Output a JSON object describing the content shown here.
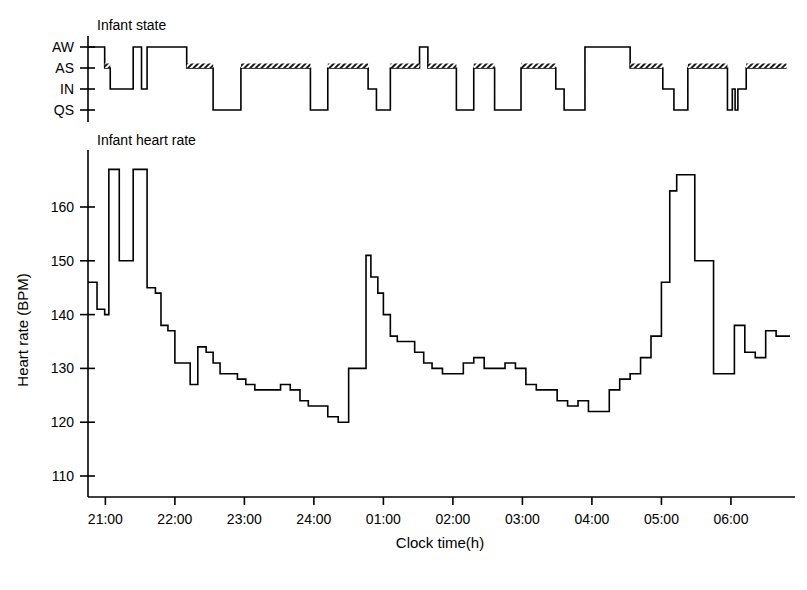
{
  "figure": {
    "background": "#ffffff",
    "line_color": "#000000",
    "panels": [
      {
        "id": "infant-state",
        "title": "Infant state",
        "y_categories": [
          "AW",
          "AS",
          "IN",
          "QS"
        ]
      },
      {
        "id": "infant-heart-rate",
        "title": "Infant heart rate",
        "y_axis_title": "Heart rate (BPM)"
      }
    ],
    "x_axis_title": "Clock time(h)",
    "x_tick_labels": [
      "21:00",
      "22:00",
      "23:00",
      "24:00",
      "01:00",
      "02:00",
      "03:00",
      "04:00",
      "05:00",
      "06:00"
    ]
  },
  "chart_data": [
    {
      "type": "line",
      "subtype": "step",
      "id": "infant-state",
      "title": "Infant state",
      "xlabel": "Clock time(h)",
      "ylabel": "",
      "y_categories": [
        "QS",
        "IN",
        "AS",
        "AW"
      ],
      "y_tick_labels": [
        "AW",
        "AS",
        "IN",
        "QS"
      ],
      "xlim": [
        20.75,
        26.8
      ],
      "x_tick_values": [
        21,
        22,
        23,
        24,
        25,
        26,
        27,
        28,
        29,
        30
      ],
      "x_tick_labels": [
        "21:00",
        "22:00",
        "23:00",
        "24:00",
        "01:00",
        "02:00",
        "03:00",
        "04:00",
        "05:00",
        "06:00"
      ],
      "grid": false,
      "legend": "none",
      "note": "Hypnogram: stepwise state trace. Segments drawn at level AS carry a hatched (cross-shaded) top edge.",
      "segments": [
        {
          "start": 20.75,
          "end": 20.99,
          "state": "AW",
          "hatched": false
        },
        {
          "start": 20.99,
          "end": 21.07,
          "state": "AS",
          "hatched": true
        },
        {
          "start": 21.07,
          "end": 21.4,
          "state": "IN",
          "hatched": false
        },
        {
          "start": 21.4,
          "end": 21.52,
          "state": "AW",
          "hatched": false
        },
        {
          "start": 21.52,
          "end": 21.6,
          "state": "IN",
          "hatched": false
        },
        {
          "start": 21.6,
          "end": 21.72,
          "state": "AW",
          "hatched": false
        },
        {
          "start": 21.72,
          "end": 22.17,
          "state": "AW",
          "hatched": false
        },
        {
          "start": 22.17,
          "end": 22.55,
          "state": "AS",
          "hatched": true
        },
        {
          "start": 22.55,
          "end": 22.95,
          "state": "QS",
          "hatched": false
        },
        {
          "start": 22.95,
          "end": 23.95,
          "state": "AS",
          "hatched": true
        },
        {
          "start": 23.95,
          "end": 24.2,
          "state": "QS",
          "hatched": false
        },
        {
          "start": 24.2,
          "end": 24.78,
          "state": "AS",
          "hatched": true
        },
        {
          "start": 24.78,
          "end": 24.9,
          "state": "IN",
          "hatched": false
        },
        {
          "start": 24.9,
          "end": 25.1,
          "state": "QS",
          "hatched": false
        },
        {
          "start": 25.1,
          "end": 25.52,
          "state": "AS",
          "hatched": true
        },
        {
          "start": 25.52,
          "end": 25.64,
          "state": "AW",
          "hatched": false
        },
        {
          "start": 25.64,
          "end": 26.05,
          "state": "AS",
          "hatched": true
        },
        {
          "start": 26.05,
          "end": 26.3,
          "state": "QS",
          "hatched": false
        },
        {
          "start": 26.3,
          "end": 26.6,
          "state": "AS",
          "hatched": true
        },
        {
          "start": 26.6,
          "end": 26.98,
          "state": "QS",
          "hatched": false
        },
        {
          "start": 26.98,
          "end": 27.48,
          "state": "AS",
          "hatched": true
        },
        {
          "start": 27.48,
          "end": 27.6,
          "state": "IN",
          "hatched": false
        },
        {
          "start": 27.6,
          "end": 27.9,
          "state": "QS",
          "hatched": false
        },
        {
          "start": 27.9,
          "end": 28.55,
          "state": "AW",
          "hatched": false
        },
        {
          "start": 28.55,
          "end": 29.02,
          "state": "AS",
          "hatched": true
        },
        {
          "start": 29.02,
          "end": 29.18,
          "state": "IN",
          "hatched": false
        },
        {
          "start": 29.18,
          "end": 29.38,
          "state": "QS",
          "hatched": false
        },
        {
          "start": 29.38,
          "end": 29.95,
          "state": "AS",
          "hatched": true
        },
        {
          "start": 29.95,
          "end": 30.02,
          "state": "QS",
          "hatched": false
        },
        {
          "start": 30.02,
          "end": 30.06,
          "state": "IN",
          "hatched": false
        },
        {
          "start": 30.06,
          "end": 30.1,
          "state": "QS",
          "hatched": false
        },
        {
          "start": 30.1,
          "end": 30.22,
          "state": "IN",
          "hatched": false
        },
        {
          "start": 30.22,
          "end": 30.8,
          "state": "AS",
          "hatched": true
        }
      ]
    },
    {
      "type": "line",
      "subtype": "step",
      "id": "infant-heart-rate",
      "title": "Infant heart rate",
      "xlabel": "Clock time(h)",
      "ylabel": "Heart rate (BPM)",
      "ylim": [
        105,
        172
      ],
      "y_tick_values": [
        110,
        120,
        130,
        140,
        150,
        160
      ],
      "y_tick_labels": [
        "110",
        "120",
        "130",
        "140",
        "150",
        "160"
      ],
      "xlim": [
        20.75,
        26.8
      ],
      "x_tick_values": [
        21,
        22,
        23,
        24,
        25,
        26,
        27,
        28,
        29,
        30
      ],
      "x_tick_labels": [
        "21:00",
        "22:00",
        "23:00",
        "24:00",
        "01:00",
        "02:00",
        "03:00",
        "04:00",
        "05:00",
        "06:00"
      ],
      "grid": false,
      "legend": "none",
      "note": "Stepwise heart-rate trace, ~5 min bins. x values are decimal clock hours (24+ = after midnight).",
      "x": [
        20.75,
        20.88,
        20.99,
        21.05,
        21.2,
        21.4,
        21.52,
        21.6,
        21.72,
        21.8,
        21.9,
        22.0,
        22.1,
        22.22,
        22.33,
        22.45,
        22.55,
        22.65,
        22.78,
        22.9,
        23.02,
        23.15,
        23.28,
        23.4,
        23.52,
        23.66,
        23.8,
        23.92,
        24.05,
        24.2,
        24.35,
        24.5,
        24.62,
        24.75,
        24.82,
        24.92,
        25.0,
        25.1,
        25.2,
        25.32,
        25.45,
        25.58,
        25.7,
        25.85,
        26.0,
        26.15,
        26.3,
        26.45,
        26.6,
        26.75,
        26.9,
        27.05,
        27.2,
        27.35,
        27.5,
        27.65,
        27.8,
        27.95,
        28.1,
        28.25,
        28.4,
        28.55,
        28.7,
        28.85,
        29.0,
        29.12,
        29.22,
        29.35,
        29.48,
        29.6,
        29.75,
        29.9,
        30.05,
        30.2,
        30.35,
        30.5,
        30.65,
        30.8
      ],
      "values": [
        146,
        141,
        140,
        167,
        150,
        167,
        167,
        145,
        144,
        138,
        137,
        131,
        131,
        127,
        134,
        133,
        131,
        129,
        129,
        128,
        127,
        126,
        126,
        126,
        127,
        126,
        124,
        123,
        123,
        121,
        120,
        130,
        130,
        151,
        147,
        144,
        140,
        136,
        135,
        135,
        133,
        131,
        130,
        129,
        129,
        131,
        132,
        130,
        130,
        131,
        130,
        127,
        126,
        126,
        124,
        123,
        124,
        122,
        122,
        126,
        128,
        129,
        132,
        136,
        146,
        163,
        166,
        166,
        150,
        150,
        129,
        129,
        138,
        133,
        132,
        137,
        136,
        136
      ]
    }
  ]
}
